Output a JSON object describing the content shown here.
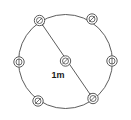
{
  "figure": {
    "background_color": "#ffffff",
    "stroke_color": "#4a4a4a",
    "marker_fill": "#ffffff",
    "label_color": "#1a1a1a"
  },
  "main_circle": {
    "name": "main-circle",
    "center_x": 65.5,
    "center_y": 61.5,
    "radius": 47.0,
    "stroke_width": 0.9
  },
  "dimension": {
    "name": "diameter-dimension",
    "label": "1m",
    "label_x": 58,
    "label_y": 78,
    "arrow_start_x": 39.5,
    "arrow_start_y": 20.5,
    "arrow_end_x": 93.0,
    "arrow_end_y": 98.5,
    "double_headed": true
  },
  "nodes": [
    {
      "name": "node-top-left",
      "cx": 39.5,
      "cy": 20.5,
      "r": 5.2,
      "glyph": "slash-diagonal",
      "position_label": "top-left"
    },
    {
      "name": "node-top-right",
      "cx": 92.0,
      "cy": 19.0,
      "r": 5.2,
      "glyph": "slash-diagonal",
      "position_label": "top-right"
    },
    {
      "name": "node-right",
      "cx": 112.0,
      "cy": 61.0,
      "r": 5.2,
      "glyph": "bar-vertical",
      "position_label": "right"
    },
    {
      "name": "node-bottom-right",
      "cx": 93.0,
      "cy": 98.5,
      "r": 5.2,
      "glyph": "slash-diagonal",
      "position_label": "bottom-right"
    },
    {
      "name": "node-bottom-left",
      "cx": 38.0,
      "cy": 101.0,
      "r": 5.2,
      "glyph": "slash-diagonal",
      "position_label": "bottom-left"
    },
    {
      "name": "node-left",
      "cx": 19.0,
      "cy": 62.0,
      "r": 5.2,
      "glyph": "bar-vertical",
      "position_label": "left"
    },
    {
      "name": "node-center",
      "cx": 65.5,
      "cy": 61.0,
      "r": 5.2,
      "glyph": "slash-diagonal",
      "position_label": "center"
    }
  ]
}
